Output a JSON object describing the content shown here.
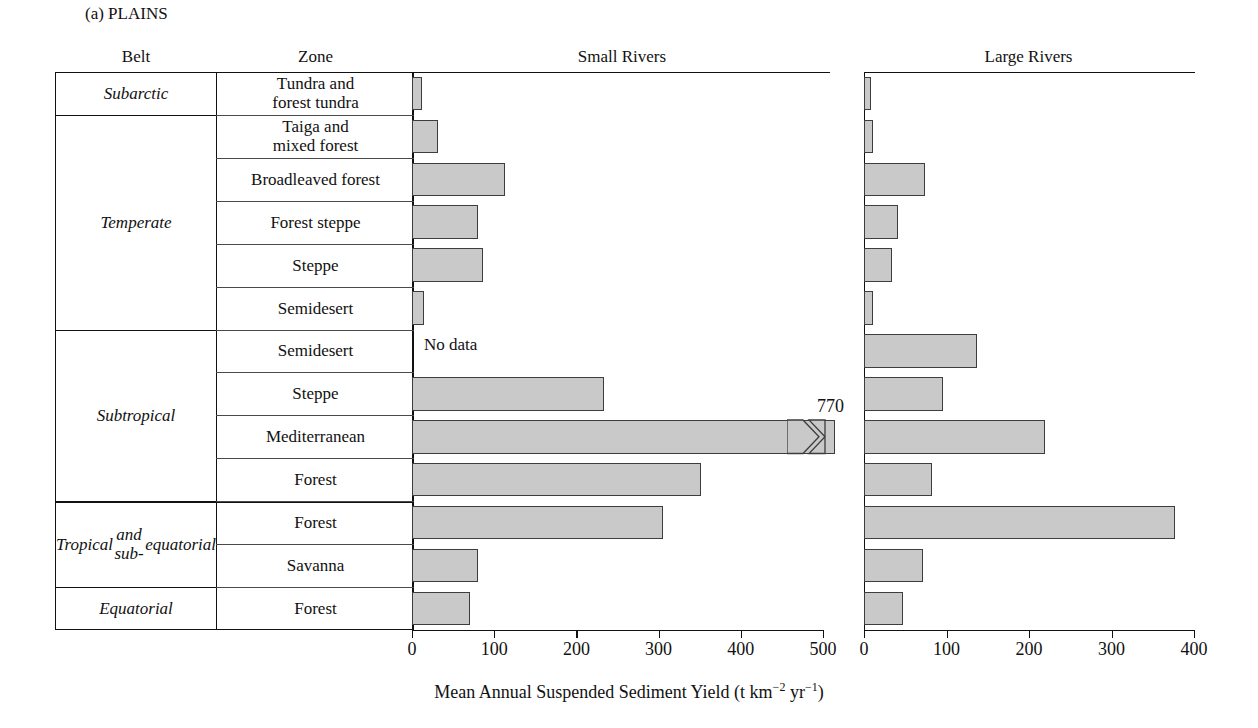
{
  "figure": {
    "panel_label": "(a)  PLAINS",
    "axis_title_main": "Mean Annual Suspended Sediment Yield (t km",
    "axis_title_exp1": "−2",
    "axis_title_mid": " yr",
    "axis_title_exp2": "−1",
    "axis_title_close": ")",
    "no_data_label": "No data",
    "break_value_label": "770",
    "fill_color": "#c9c9c9",
    "stroke_color": "#3d3d3d"
  },
  "headers": {
    "belt": "Belt",
    "zone": "Zone",
    "small_rivers": "Small Rivers",
    "large_rivers": "Large Rivers"
  },
  "belts": [
    {
      "label": "Subarctic",
      "rows": 1
    },
    {
      "label": "Temperate",
      "rows": 5
    },
    {
      "label": "Subtropical",
      "rows": 4
    },
    {
      "label": "Tropical\nand sub-\nequatorial",
      "rows": 2
    },
    {
      "label": "Equatorial",
      "rows": 1
    }
  ],
  "chart_data": {
    "type": "bar",
    "title": "(a)  PLAINS",
    "xlabel": "Mean Annual Suspended Sediment Yield (t km−2 yr−1)",
    "ylabel": "",
    "orientation": "horizontal",
    "grid": false,
    "legend": "none",
    "categories": [
      "Tundra and forest tundra",
      "Taiga and mixed forest",
      "Broadleaved forest",
      "Forest steppe",
      "Steppe",
      "Semidesert",
      "Semidesert",
      "Steppe",
      "Mediterranean",
      "Forest",
      "Forest",
      "Savanna",
      "Forest"
    ],
    "belt_of_category": [
      "Subarctic",
      "Temperate",
      "Temperate",
      "Temperate",
      "Temperate",
      "Temperate",
      "Subtropical",
      "Subtropical",
      "Subtropical",
      "Subtropical",
      "Tropical and sub-equatorial",
      "Tropical and sub-equatorial",
      "Equatorial"
    ],
    "series": [
      {
        "name": "Small Rivers",
        "xlim": [
          0,
          500
        ],
        "xticks": [
          0,
          100,
          200,
          300,
          400,
          500
        ],
        "values": [
          12,
          32,
          113,
          80,
          86,
          14,
          null,
          233,
          770,
          351,
          305,
          80,
          71
        ],
        "broken_axis_indices": [
          8
        ],
        "null_note_indices": [
          6
        ]
      },
      {
        "name": "Large Rivers",
        "xlim": [
          0,
          400
        ],
        "xticks": [
          0,
          100,
          200,
          300,
          400
        ],
        "values": [
          9,
          11,
          74,
          41,
          34,
          11,
          137,
          96,
          219,
          82,
          377,
          72,
          47
        ],
        "broken_axis_indices": [],
        "null_note_indices": []
      }
    ]
  }
}
